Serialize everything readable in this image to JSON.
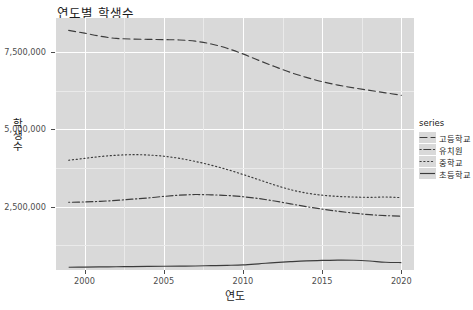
{
  "chart_data": {
    "type": "line",
    "title": "연도별 학생수",
    "xlabel": "연도",
    "ylabel": "학생수",
    "legend_title": "series",
    "legend_position": "right",
    "grid": true,
    "xlim": [
      1998.2,
      2020.8
    ],
    "ylim": [
      450000,
      8600000
    ],
    "xticks": [
      "2000",
      "2005",
      "2010",
      "2015",
      "2020"
    ],
    "xtick_values": [
      2000,
      2005,
      2010,
      2015,
      2020
    ],
    "yticks": [
      "2,500,000",
      "5,000,000",
      "7,500,000"
    ],
    "ytick_values": [
      2500000,
      5000000,
      7500000
    ],
    "x": [
      1999,
      2000,
      2001,
      2002,
      2003,
      2004,
      2005,
      2006,
      2007,
      2008,
      2009,
      2010,
      2011,
      2012,
      2013,
      2014,
      2015,
      2016,
      2017,
      2018,
      2019,
      2020
    ],
    "series": [
      {
        "name": "고등학교",
        "linetype": "dashed",
        "values": [
          8200000,
          8110000,
          8010000,
          7940000,
          7920000,
          7910000,
          7900000,
          7890000,
          7850000,
          7760000,
          7620000,
          7440000,
          7230000,
          7030000,
          6840000,
          6680000,
          6540000,
          6430000,
          6340000,
          6260000,
          6180000,
          6100000
        ]
      },
      {
        "name": "유치원",
        "linetype": "dotdash",
        "values": [
          2640000,
          2650000,
          2670000,
          2700000,
          2740000,
          2780000,
          2830000,
          2870000,
          2890000,
          2880000,
          2860000,
          2820000,
          2760000,
          2680000,
          2590000,
          2500000,
          2420000,
          2350000,
          2290000,
          2240000,
          2210000,
          2190000
        ]
      },
      {
        "name": "중학교",
        "linetype": "dotted",
        "values": [
          4000000,
          4060000,
          4120000,
          4160000,
          4180000,
          4170000,
          4130000,
          4060000,
          3960000,
          3840000,
          3700000,
          3540000,
          3370000,
          3200000,
          3050000,
          2940000,
          2870000,
          2830000,
          2810000,
          2800000,
          2810000,
          2790000
        ]
      },
      {
        "name": "초등학교",
        "linetype": "solid",
        "values": [
          540000,
          545000,
          550000,
          555000,
          560000,
          565000,
          570000,
          575000,
          580000,
          590000,
          600000,
          615000,
          650000,
          690000,
          720000,
          745000,
          760000,
          770000,
          765000,
          740000,
          700000,
          690000
        ]
      }
    ]
  }
}
